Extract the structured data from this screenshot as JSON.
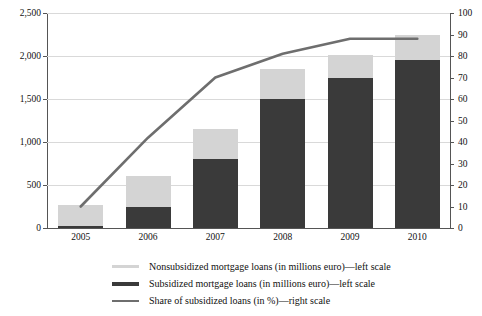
{
  "chart_data": {
    "type": "bar",
    "title": "",
    "subtitle": "",
    "xlabel": "",
    "ylabel": "",
    "categories": [
      "2005",
      "2006",
      "2007",
      "2008",
      "2009",
      "2010"
    ],
    "series": [
      {
        "name": "Subsidized mortgage loans (in millions euro)—left scale",
        "type": "bar",
        "axis": "left",
        "color": "#3a3a3a",
        "values": [
          20,
          240,
          800,
          1500,
          1740,
          1950
        ]
      },
      {
        "name": "Nonsubsidized mortgage loans (in millions euro)—left scale",
        "type": "bar",
        "axis": "left",
        "color": "#d4d4d4",
        "values": [
          250,
          370,
          350,
          350,
          270,
          300
        ]
      },
      {
        "name": "Share of subsidized loans (in %)—right scale",
        "type": "line",
        "axis": "right",
        "color": "#6e6e6e",
        "values": [
          10,
          42,
          70,
          81,
          88,
          88
        ]
      }
    ],
    "totals": [
      270,
      610,
      1150,
      1850,
      2010,
      2250
    ],
    "stacked": true,
    "grid": true,
    "legend_position": "bottom",
    "left_axis": {
      "min": 0,
      "max": 2500,
      "step": 500,
      "ticks": [
        "0",
        "500",
        "1,000",
        "1,500",
        "2,000",
        "2,500"
      ]
    },
    "right_axis": {
      "min": 0,
      "max": 100,
      "step": 10,
      "ticks": [
        "0",
        "10",
        "20",
        "30",
        "40",
        "50",
        "60",
        "70",
        "80",
        "90",
        "100"
      ]
    }
  },
  "legend": {
    "items": [
      {
        "marker": "nonsubsidized-swatch",
        "label": "Nonsubsidized mortgage loans (in millions euro)—left scale"
      },
      {
        "marker": "subsidized-swatch",
        "label": "Subsidized mortgage loans (in millions euro)—left scale"
      },
      {
        "marker": "share-line-swatch",
        "label": "Share of subsidized loans (in %)—right scale"
      }
    ]
  },
  "colors": {
    "subsidized": "#3a3a3a",
    "nonsubsidized": "#d4d4d4",
    "share_line": "#6e6e6e",
    "grid": "#d9d9d9",
    "axis": "#555555",
    "background": "#ffffff"
  }
}
